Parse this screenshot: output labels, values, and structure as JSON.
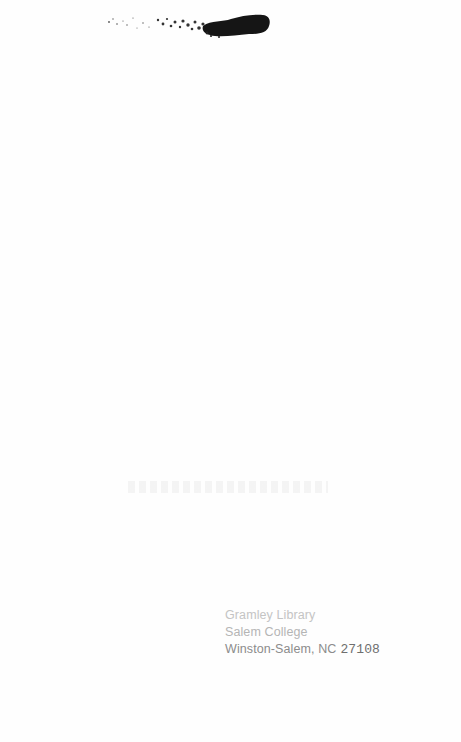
{
  "page": {
    "type": "scanned-blank-page",
    "background_color": "#fefefe"
  },
  "top_mark": {
    "description": "ink smudge / torn label residue",
    "color": "#1a1a1a"
  },
  "library_stamp": {
    "line1": "Gramley Library",
    "line2": "Salem College",
    "line3_city": "Winston-Salem, NC",
    "line3_zip": "27108"
  }
}
